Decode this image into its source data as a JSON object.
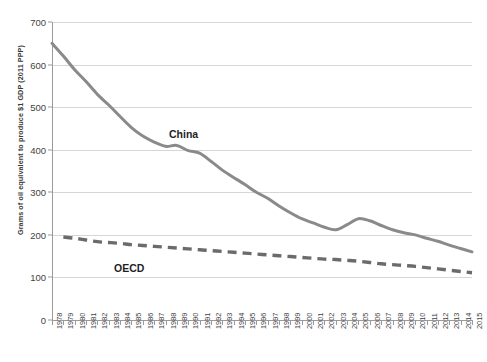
{
  "chart_data": {
    "type": "line",
    "title": "",
    "subtitle": "",
    "xlabel": "",
    "ylabel": "Grams of oil equivalent to produce $1 GDP (2011 PPP)",
    "ylim": [
      0,
      700
    ],
    "ytick_step": 100,
    "yticks": [
      0,
      100,
      200,
      300,
      400,
      500,
      600,
      700
    ],
    "ytick_labels": [
      "0",
      "100",
      "200",
      "300",
      "400",
      "500",
      "600",
      "700"
    ],
    "grid": "horizontal",
    "legend": "inline-annotations",
    "x": [
      1978,
      1979,
      1980,
      1981,
      1982,
      1983,
      1984,
      1985,
      1986,
      1987,
      1988,
      1989,
      1990,
      1991,
      1992,
      1993,
      1994,
      1995,
      1996,
      1997,
      1998,
      1999,
      2000,
      2001,
      2002,
      2003,
      2004,
      2005,
      2006,
      2007,
      2008,
      2009,
      2010,
      2011,
      2012,
      2013,
      2014,
      2015
    ],
    "xtick_labels": [
      "1978",
      "1979",
      "1980",
      "1981",
      "1982",
      "1983",
      "1984",
      "1985",
      "1986",
      "1987",
      "1988",
      "1989",
      "1990",
      "1991",
      "1992",
      "1993",
      "1994",
      "1995",
      "1996",
      "1997",
      "1998",
      "1999",
      "2000",
      "2001",
      "2002",
      "2003",
      "2004",
      "2005",
      "2006",
      "2007",
      "2008",
      "2009",
      "2010",
      "2011",
      "2012",
      "2013",
      "2014",
      "2015"
    ],
    "series": [
      {
        "name": "China",
        "style": "solid",
        "color": "#8a8a8a",
        "annotation_label": "China",
        "values": [
          650,
          620,
          588,
          560,
          530,
          505,
          478,
          452,
          432,
          418,
          408,
          410,
          398,
          392,
          373,
          352,
          335,
          318,
          300,
          286,
          268,
          252,
          238,
          228,
          218,
          212,
          224,
          238,
          233,
          222,
          212,
          205,
          200,
          192,
          185,
          176,
          168,
          160
        ]
      },
      {
        "name": "OECD",
        "style": "dashed",
        "color": "#6b6b6b",
        "annotation_label": "OECD",
        "values": [
          null,
          195,
          192,
          188,
          184,
          182,
          180,
          177,
          175,
          173,
          171,
          169,
          167,
          165,
          163,
          161,
          159,
          157,
          155,
          153,
          151,
          149,
          147,
          145,
          143,
          142,
          140,
          138,
          135,
          132,
          130,
          128,
          126,
          123,
          120,
          117,
          114,
          111
        ]
      }
    ]
  }
}
